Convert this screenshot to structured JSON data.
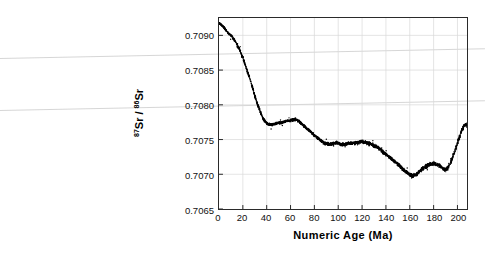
{
  "chart_data": {
    "type": "scatter",
    "title": "",
    "xlabel": "Numeric Age (Ma)",
    "ylabel": "87Sr / 86Sr",
    "ylabel_numerator": "87",
    "ylabel_denominator": "86",
    "ylabel_element": "Sr",
    "xlim": [
      0,
      208
    ],
    "ylim": [
      0.7065,
      0.70925
    ],
    "xticks": [
      0,
      20,
      40,
      60,
      80,
      100,
      120,
      140,
      160,
      180,
      200
    ],
    "yticks": [
      0.7065,
      0.707,
      0.7075,
      0.708,
      0.7085,
      0.709
    ],
    "ytick_labels": [
      "0.7065",
      "0.7070",
      "0.7075",
      "0.7080",
      "0.7085",
      "0.7090"
    ],
    "xtick_labels": [
      "0",
      "20",
      "40",
      "60",
      "80",
      "100",
      "120",
      "140",
      "160",
      "180",
      "200"
    ],
    "grid": true,
    "legend": "none",
    "marker_color": "#000000",
    "grid_color": "#d9d9d9",
    "frame_color": "#2a2a2a",
    "background": "#ffffff",
    "series": [
      {
        "name": "Seawater 87Sr/86Sr",
        "x": [
          0,
          1,
          2,
          3,
          4,
          5,
          6,
          7,
          8,
          9,
          10,
          11,
          12,
          13,
          14,
          15,
          16,
          17,
          18,
          19,
          20,
          21,
          22,
          23,
          24,
          25,
          26,
          27,
          28,
          29,
          30,
          31,
          32,
          33,
          34,
          35,
          36,
          37,
          38,
          39,
          40,
          41,
          42,
          43,
          44,
          45,
          46,
          47,
          48,
          49,
          50,
          51,
          52,
          53,
          54,
          55,
          56,
          57,
          58,
          59,
          60,
          61,
          62,
          63,
          64,
          65,
          66,
          67,
          68,
          69,
          70,
          72,
          74,
          76,
          78,
          80,
          82,
          84,
          86,
          88,
          90,
          92,
          94,
          96,
          98,
          100,
          102,
          104,
          106,
          108,
          110,
          112,
          114,
          116,
          118,
          120,
          122,
          124,
          126,
          128,
          130,
          132,
          134,
          136,
          138,
          140,
          142,
          144,
          146,
          148,
          150,
          152,
          154,
          156,
          158,
          160,
          162,
          164,
          166,
          168,
          170,
          172,
          174,
          176,
          178,
          180,
          182,
          184,
          186,
          188,
          190,
          192,
          194,
          196,
          198,
          200,
          202,
          204,
          206
        ],
        "y": [
          0.709175,
          0.709165,
          0.70915,
          0.709135,
          0.709115,
          0.709095,
          0.70907,
          0.70905,
          0.70903,
          0.709015,
          0.709,
          0.70898,
          0.708955,
          0.70893,
          0.708905,
          0.708875,
          0.70884,
          0.708805,
          0.708765,
          0.70872,
          0.708675,
          0.708625,
          0.708575,
          0.708525,
          0.708475,
          0.708425,
          0.70837,
          0.708315,
          0.708255,
          0.708195,
          0.708135,
          0.70808,
          0.708025,
          0.707975,
          0.70793,
          0.707885,
          0.70784,
          0.707805,
          0.707775,
          0.707755,
          0.707735,
          0.707725,
          0.70772,
          0.707715,
          0.707715,
          0.707718,
          0.707722,
          0.707726,
          0.70773,
          0.707733,
          0.707736,
          0.70774,
          0.707744,
          0.707748,
          0.707752,
          0.707756,
          0.70776,
          0.707764,
          0.707768,
          0.707772,
          0.707776,
          0.70778,
          0.707784,
          0.707788,
          0.707786,
          0.707782,
          0.707775,
          0.707762,
          0.707748,
          0.707732,
          0.707715,
          0.707685,
          0.707655,
          0.707625,
          0.707595,
          0.707565,
          0.707535,
          0.707505,
          0.707478,
          0.707455,
          0.70744,
          0.70743,
          0.707432,
          0.707445,
          0.707455,
          0.707448,
          0.707435,
          0.707428,
          0.707432,
          0.707445,
          0.707452,
          0.707448,
          0.707452,
          0.70746,
          0.707465,
          0.70747,
          0.707462,
          0.707452,
          0.707442,
          0.70743,
          0.707415,
          0.707395,
          0.707372,
          0.707345,
          0.707315,
          0.707285,
          0.70726,
          0.707232,
          0.707205,
          0.707175,
          0.707145,
          0.707112,
          0.707078,
          0.707048,
          0.707025,
          0.706995,
          0.70698,
          0.706985,
          0.707005,
          0.707035,
          0.707068,
          0.707098,
          0.707122,
          0.707138,
          0.707148,
          0.707152,
          0.707148,
          0.707135,
          0.707112,
          0.707082,
          0.707065,
          0.707095,
          0.70716,
          0.707248,
          0.707345,
          0.707452,
          0.707555,
          0.707645,
          0.70771
        ]
      }
    ],
    "annotations": []
  },
  "artifacts": [
    {
      "name": "scan-streak-upper",
      "x": 0,
      "y": 58,
      "width": 485,
      "rotate": -1.15
    },
    {
      "name": "scan-streak-lower",
      "x": 0,
      "y": 110,
      "width": 485,
      "rotate": -1.15
    }
  ]
}
